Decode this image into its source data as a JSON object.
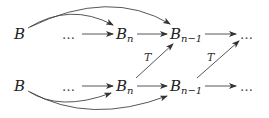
{
  "diagram": {
    "top_row": {
      "b": "B",
      "dots_left": "…",
      "bn_base": "B",
      "bn_sub": "n",
      "bn1_base": "B",
      "bn1_sub": "n−1",
      "dots_right": "…"
    },
    "bottom_row": {
      "b": "B",
      "dots_left": "…",
      "bn_base": "B",
      "bn_sub": "n",
      "bn1_base": "B",
      "bn1_sub": "n−1",
      "dots_right": "…"
    },
    "diagonal_labels": [
      "T",
      "T"
    ],
    "edges": [
      {
        "from": "top.B",
        "to": "top.B_n",
        "style": "curved"
      },
      {
        "from": "top.B",
        "to": "top.B_n-1",
        "style": "curved"
      },
      {
        "from": "top.dots",
        "to": "top.B_n"
      },
      {
        "from": "top.B_n",
        "to": "top.B_n-1"
      },
      {
        "from": "top.B_n-1",
        "to": "top.dots"
      },
      {
        "from": "bottom.B",
        "to": "bottom.B_n",
        "style": "curved"
      },
      {
        "from": "bottom.B",
        "to": "bottom.B_n-1",
        "style": "curved"
      },
      {
        "from": "bottom.dots",
        "to": "bottom.B_n"
      },
      {
        "from": "bottom.B_n",
        "to": "bottom.B_n-1"
      },
      {
        "from": "bottom.B_n-1",
        "to": "bottom.dots"
      },
      {
        "from": "bottom.B_n",
        "to": "top.B_n-1",
        "label": "T"
      },
      {
        "from": "bottom.B_n-1",
        "to": "top.dots",
        "label": "T"
      }
    ]
  }
}
